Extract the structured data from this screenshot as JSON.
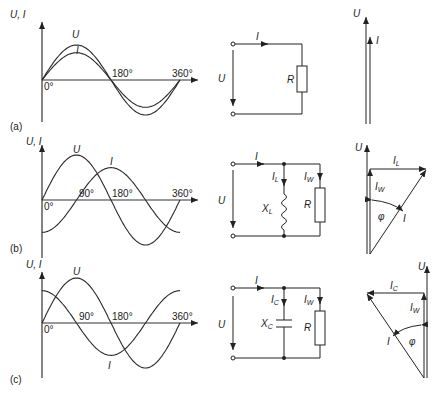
{
  "rows": [
    {
      "label": "(a)",
      "graph": {
        "yaxis_label": "U, I",
        "origin_label": "0°",
        "ticks": [
          "180°",
          "360°"
        ],
        "curves": [
          {
            "name": "U",
            "amplitude": 1.0,
            "phase_deg": 0
          },
          {
            "name": "I",
            "amplitude": 0.78,
            "phase_deg": 0
          }
        ]
      },
      "circuit": {
        "current": "I",
        "voltage": "U",
        "components": [
          "R"
        ]
      },
      "phasor": {
        "labels": [
          "U",
          "I"
        ]
      }
    },
    {
      "label": "(b)",
      "graph": {
        "yaxis_label": "U, I",
        "origin_label": "0°",
        "ticks": [
          "90°",
          "180°",
          "360°"
        ],
        "curves": [
          {
            "name": "U",
            "amplitude": 1.0,
            "phase_deg": 0
          },
          {
            "name": "I",
            "amplitude": 0.72,
            "phase_deg": -90
          }
        ]
      },
      "circuit": {
        "current": "I",
        "voltage": "U",
        "branch_currents": [
          "I_L",
          "I_W"
        ],
        "components": [
          "X_L",
          "R"
        ]
      },
      "phasor": {
        "labels": [
          "U",
          "I_L",
          "I_W",
          "φ",
          "I"
        ]
      }
    },
    {
      "label": "(c)",
      "graph": {
        "yaxis_label": "U, I",
        "origin_label": "0°",
        "ticks": [
          "90°",
          "180°",
          "360°"
        ],
        "curves": [
          {
            "name": "U",
            "amplitude": 1.0,
            "phase_deg": 0
          },
          {
            "name": "I",
            "amplitude": 0.72,
            "phase_deg": 90
          }
        ]
      },
      "circuit": {
        "current": "I",
        "voltage": "U",
        "branch_currents": [
          "I_C",
          "I_W"
        ],
        "components": [
          "X_C",
          "R"
        ]
      },
      "phasor": {
        "labels": [
          "U",
          "I_C",
          "I_W",
          "φ",
          "I"
        ]
      }
    }
  ],
  "text": {
    "ui": "U, I",
    "U": "U",
    "I": "I",
    "R": "R",
    "X": "X",
    "L": "L",
    "C": "C",
    "W": "W",
    "phi": "φ",
    "deg0": "0°",
    "deg90": "90°",
    "deg180": "180°",
    "deg360": "360°",
    "la": "(a)",
    "lb": "(b)",
    "lc": "(c)"
  }
}
